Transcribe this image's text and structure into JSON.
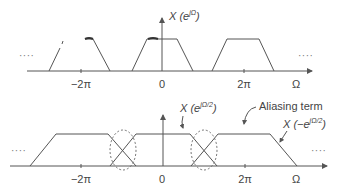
{
  "top_plot": {
    "label_main": "X (e",
    "label_sup": "jΩ",
    "label_close": ")",
    "ticks": [
      "−2π",
      "0",
      "2π"
    ],
    "axis_label": "Ω",
    "ellipsis_left": "····",
    "ellipsis_right": "····"
  },
  "bottom_plot": {
    "label_1_main": "X (e",
    "label_1_sup": "jΩ/2",
    "label_1_close": ")",
    "aliasing_label": "Aliasing term",
    "label_2_main": "X (−e",
    "label_2_sup": "jΩ/2",
    "label_2_close": ")",
    "ticks": [
      "−2π",
      "0",
      "2π"
    ],
    "axis_label": "Ω",
    "ellipsis_left": "····",
    "ellipsis_right": "····"
  },
  "colors": {
    "line": "#555555",
    "background": "#ffffff"
  }
}
